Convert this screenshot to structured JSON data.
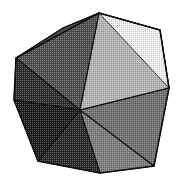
{
  "figure": {
    "rendering": "halftone-dithered grayscale shading",
    "background_color": "#ffffff",
    "edge_color": "#111111",
    "canvas": {
      "width": 185,
      "height": 186
    }
  },
  "geometry": {
    "vertices": {
      "top": [
        99,
        13
      ],
      "upper_right": [
        160,
        30
      ],
      "right": [
        169,
        88
      ],
      "lower_right": [
        154,
        166
      ],
      "bottom": [
        100,
        173
      ],
      "lower_left": [
        38,
        161
      ],
      "left_lower": [
        14,
        100
      ],
      "left_upper": [
        16,
        58
      ],
      "upper_left_ridge": [
        63,
        28
      ],
      "center": [
        80,
        110
      ]
    },
    "outline_order": [
      "top",
      "upper_right",
      "right",
      "lower_right",
      "bottom",
      "lower_left",
      "left_lower",
      "left_upper"
    ]
  },
  "faces": [
    {
      "id": "face-top-left-sliver",
      "label": "Top-left ridge sliver",
      "points": "99,13 63,28 16,58",
      "fill": "#1c1c1c",
      "tone": "very-dark"
    },
    {
      "id": "face-upper-left",
      "label": "Upper-left face",
      "points": "16,58 63,28 99,13 80,110",
      "fill": "#4e4e4e",
      "tone": "dark-medium"
    },
    {
      "id": "face-left",
      "label": "Left face",
      "points": "16,58 80,110 14,100",
      "fill": "#2b2b2b",
      "tone": "dark"
    },
    {
      "id": "face-lower-left",
      "label": "Lower-left face",
      "points": "14,100 80,110 38,161",
      "fill": "#1a1a1a",
      "tone": "very-dark"
    },
    {
      "id": "face-bottom-left",
      "label": "Bottom-left face",
      "points": "38,161 80,110 100,173",
      "fill": "#262626",
      "tone": "dark"
    },
    {
      "id": "face-bottom-right",
      "label": "Bottom-right face",
      "points": "100,173 80,110 154,166",
      "fill": "#7b7b7b",
      "tone": "medium"
    },
    {
      "id": "face-right",
      "label": "Right face",
      "points": "154,166 80,110 169,88",
      "fill": "#6e6e6e",
      "tone": "medium"
    },
    {
      "id": "face-upper-right",
      "label": "Upper-right face",
      "points": "169,88 80,110 99,13 160,30",
      "fill": "#b4b4b4",
      "tone": "light"
    },
    {
      "id": "face-top-highlight",
      "label": "Top-right highlight face",
      "points": "99,13 160,30 169,88",
      "fill": "#f2f2f2",
      "tone": "near-white"
    }
  ],
  "interior_edges": [
    {
      "id": "edge-center-top",
      "from": "center",
      "to": "top"
    },
    {
      "id": "edge-center-left-upper",
      "from": "center",
      "to": "left_upper"
    },
    {
      "id": "edge-center-left-lower",
      "from": "center",
      "to": "left_lower"
    },
    {
      "id": "edge-center-lower-left",
      "from": "center",
      "to": "lower_left"
    },
    {
      "id": "edge-center-bottom",
      "from": "center",
      "to": "bottom"
    },
    {
      "id": "edge-center-lower-right",
      "from": "center",
      "to": "lower_right"
    },
    {
      "id": "edge-center-right",
      "from": "center",
      "to": "right"
    },
    {
      "id": "edge-ridge-top-left",
      "from": "top",
      "to": "upper_left_ridge"
    },
    {
      "id": "edge-ridge-left",
      "from": "upper_left_ridge",
      "to": "left_upper"
    },
    {
      "id": "edge-top-upper-right",
      "from": "top",
      "to": "upper_right"
    },
    {
      "id": "edge-upper-right-right",
      "from": "upper_right",
      "to": "right"
    }
  ]
}
